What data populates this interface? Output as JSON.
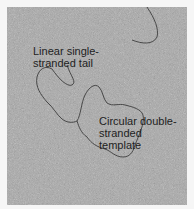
{
  "figure": {
    "type": "electron micrograph",
    "background_color": "#a9a9a9",
    "strand_color": "#3c3c3c",
    "labels": [
      {
        "id": "tail",
        "text_line1": "Linear single-",
        "text_line2": "stranded tail"
      },
      {
        "id": "template",
        "text_line1": "Circular double-",
        "text_line2": "stranded template"
      }
    ]
  }
}
